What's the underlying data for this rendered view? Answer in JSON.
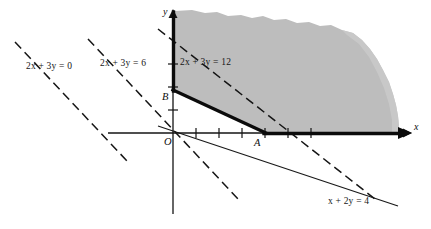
{
  "figure": {
    "kind": "linear-programming-feasible-region",
    "background_color": "#ffffff",
    "shade_color": "#bdbdbd",
    "ink_color": "#111111"
  },
  "axes": {
    "x_label": "x",
    "y_label": "y",
    "origin_label": "O",
    "origin_px": [
      173,
      133
    ],
    "unit_px": 23,
    "x_axis_from_px": [
      108,
      133
    ],
    "x_axis_to_px": [
      410,
      133
    ],
    "y_axis_from_px": [
      173,
      214
    ],
    "y_axis_to_px": [
      173,
      11
    ],
    "x_ticks_units": [
      1,
      2,
      3,
      4,
      5,
      6
    ],
    "y_ticks_units": [
      1,
      2,
      3
    ]
  },
  "points": [
    {
      "name": "A",
      "label": "A",
      "x": 4,
      "y": 0,
      "px": [
        265,
        133
      ],
      "label_px": [
        256,
        139
      ]
    },
    {
      "name": "B",
      "label": "B",
      "x": 0,
      "y": 2,
      "px": [
        173,
        90
      ],
      "label_px": [
        163,
        90
      ]
    }
  ],
  "constraint_lines": [
    {
      "id": "x-plus-2y-eq-4",
      "label": "x + 2y = 4",
      "style": "solid-thin",
      "label_px": [
        328,
        196
      ],
      "from_px": [
        158,
        126
      ],
      "to_px": [
        398,
        206
      ]
    }
  ],
  "objective_lines": [
    {
      "id": "obj-0",
      "label": "2x + 3y = 0",
      "value": 0,
      "style": "dashed",
      "label_px": [
        26,
        61
      ],
      "from_px": [
        15,
        42
      ],
      "to_px": [
        128,
        162
      ]
    },
    {
      "id": "obj-6",
      "label": "2x + 3y = 6",
      "value": 6,
      "style": "dashed",
      "label_px": [
        100,
        58
      ],
      "from_px": [
        88,
        39
      ],
      "to_px": [
        238,
        199
      ]
    },
    {
      "id": "obj-12",
      "label": "2x + 3y = 12",
      "value": 12,
      "style": "dashed",
      "label_px": [
        180,
        57
      ],
      "from_px": [
        158,
        29
      ],
      "to_px": [
        375,
        199
      ]
    }
  ],
  "boundary": {
    "style": "solid-thick",
    "description": "feasible region boundary: y-axis above B, segment B to A, x-axis right of A",
    "segments": [
      {
        "from_px": [
          173,
          90
        ],
        "to_px": [
          173,
          11
        ]
      },
      {
        "from_px": [
          173,
          90
        ],
        "to_px": [
          265,
          133
        ]
      },
      {
        "from_px": [
          265,
          133
        ],
        "to_px": [
          403,
          133
        ]
      }
    ]
  },
  "shaded_region": {
    "fill": "#bdbdbd",
    "description": "feasible region: x>=0, y>=0, x+2y>=4, shaded with hand-drawn outer edge"
  },
  "labels": {
    "obj0": "2x + 3y = 0",
    "obj6": "2x + 3y = 6",
    "obj12": "2x + 3y = 12",
    "constraint": "x + 2y = 4",
    "x_axis": "x",
    "y_axis": "y",
    "origin": "O",
    "point_a": "A",
    "point_b": "B"
  }
}
